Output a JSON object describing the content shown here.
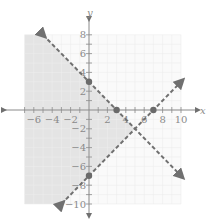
{
  "chart_data": {
    "type": "line",
    "title": "",
    "xlabel": "x",
    "ylabel": "y",
    "xlim": [
      -7,
      10
    ],
    "ylim": [
      -10,
      8
    ],
    "grid": true,
    "x_ticks": [
      -6,
      -4,
      -2,
      2,
      4,
      6,
      8,
      10
    ],
    "y_ticks": [
      8,
      6,
      4,
      2,
      -2,
      -4,
      -6,
      -8,
      -10
    ],
    "series": [
      {
        "name": "y = -x + 3",
        "style": "dashed",
        "color": "#707070",
        "x": [
          -5,
          10
        ],
        "y": [
          8,
          -7
        ],
        "marked_points": [
          [
            0,
            3
          ],
          [
            3,
            0
          ]
        ]
      },
      {
        "name": "y = x - 7",
        "style": "dashed",
        "color": "#707070",
        "x": [
          -3,
          10
        ],
        "y": [
          -10,
          3
        ],
        "marked_points": [
          [
            0,
            -7
          ],
          [
            7,
            0
          ]
        ]
      }
    ],
    "shaded_region": {
      "description": "Region below y = -x + 3 and above y = x - 7 (left wedge, x < 5)",
      "color": "#e4e4e4"
    },
    "intersection": [
      5,
      -2
    ]
  }
}
